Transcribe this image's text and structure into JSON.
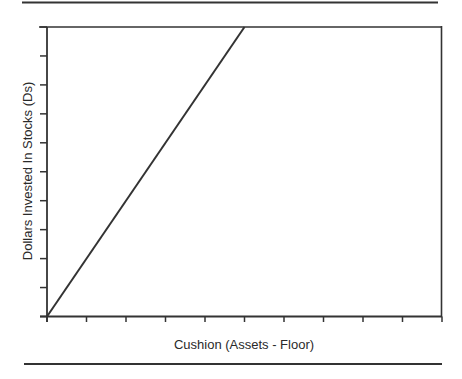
{
  "figure": {
    "background": "#ffffff",
    "ink_color": "#333333"
  },
  "chart_data": {
    "type": "line",
    "title": "",
    "xlabel": "Cushion (Assets - Floor)",
    "ylabel": "Dollars Invested In Stocks (Ds)",
    "xlim": [
      0,
      10
    ],
    "ylim": [
      0,
      10
    ],
    "x_ticks": [
      0,
      1,
      2,
      3,
      4,
      5,
      6,
      7,
      8,
      9,
      10
    ],
    "y_ticks": [
      0,
      1,
      2,
      3,
      4,
      5,
      6,
      7,
      8,
      9,
      10
    ],
    "x_tick_labels": [],
    "y_tick_labels": [],
    "grid": false,
    "legend": null,
    "frame": "box",
    "series": [
      {
        "name": "Ds vs Cushion",
        "x": [
          0,
          5
        ],
        "y": [
          0,
          10
        ],
        "color": "#333333",
        "note": "linear, slope ≈ 2 tick-units per tick-unit; reaches top of plot at x ≈ 5"
      }
    ],
    "decorations": {
      "top_rule": true,
      "bottom_rule": true
    }
  }
}
